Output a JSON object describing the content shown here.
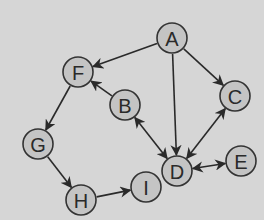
{
  "diagram": {
    "type": "directed-graph",
    "colors": {
      "background": "#d6d6d6",
      "node_fill": "#c4c4c4",
      "node_stroke": "#333333",
      "edge": "#2a2a2a",
      "label": "#2a2a2a"
    },
    "node_radius": 15,
    "nodes": [
      {
        "id": "A",
        "label": "A",
        "x": 172,
        "y": 38
      },
      {
        "id": "B",
        "label": "B",
        "x": 125,
        "y": 105
      },
      {
        "id": "C",
        "label": "C",
        "x": 235,
        "y": 96
      },
      {
        "id": "D",
        "label": "D",
        "x": 177,
        "y": 171
      },
      {
        "id": "E",
        "label": "E",
        "x": 241,
        "y": 161
      },
      {
        "id": "F",
        "label": "F",
        "x": 78,
        "y": 72
      },
      {
        "id": "G",
        "label": "G",
        "x": 38,
        "y": 144
      },
      {
        "id": "H",
        "label": "H",
        "x": 81,
        "y": 200
      },
      {
        "id": "I",
        "label": "I",
        "x": 146,
        "y": 187
      }
    ],
    "edges": [
      {
        "from": "A",
        "to": "F",
        "direction": "forward"
      },
      {
        "from": "A",
        "to": "D",
        "direction": "forward"
      },
      {
        "from": "A",
        "to": "C",
        "direction": "forward"
      },
      {
        "from": "B",
        "to": "F",
        "direction": "forward"
      },
      {
        "from": "B",
        "to": "D",
        "direction": "both"
      },
      {
        "from": "C",
        "to": "D",
        "direction": "both"
      },
      {
        "from": "D",
        "to": "E",
        "direction": "both"
      },
      {
        "from": "F",
        "to": "G",
        "direction": "forward"
      },
      {
        "from": "G",
        "to": "H",
        "direction": "forward"
      },
      {
        "from": "H",
        "to": "I",
        "direction": "forward"
      }
    ]
  }
}
